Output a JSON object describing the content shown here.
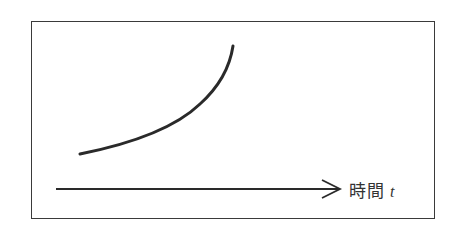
{
  "diagram": {
    "x_axis_label": "時間",
    "x_axis_variable": "t",
    "curve": "increasing convex (exponential-like) growth curve",
    "colors": {
      "line": "#2a2a2a",
      "frame": "#3a3a3a",
      "background": "#ffffff"
    }
  }
}
